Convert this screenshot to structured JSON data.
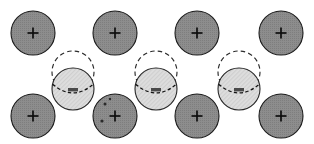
{
  "figure": {
    "canvas": {
      "width": 314,
      "height": 144,
      "background": "#ffffff"
    },
    "palette": {
      "dark_particle_fill": "#8a8a8a",
      "dark_particle_stroke": "#1a1a1a",
      "light_particle_fill": "#d9d9d9",
      "light_particle_stroke": "#262626",
      "ghost_stroke": "#2b2b2b",
      "marker_color": "#141414",
      "background": "#ffffff"
    },
    "legend_note": "",
    "rows": [
      {
        "name": "top-row",
        "kind": "dark-hatched-particle",
        "radius": 22,
        "center_y": 33,
        "marker": "plus",
        "particles": [
          {
            "id": "top-1",
            "cx": 33,
            "cy": 33
          },
          {
            "id": "top-2",
            "cx": 115,
            "cy": 33
          },
          {
            "id": "top-3",
            "cx": 197,
            "cy": 33
          },
          {
            "id": "top-4",
            "cx": 281,
            "cy": 33
          }
        ]
      },
      {
        "name": "middle-row",
        "kind": "light-particle-with-ghost",
        "radius": 21,
        "ghost_radius": 21,
        "ghost_center_y": 72,
        "center_y": 89,
        "marker": "dashed-chord",
        "particles": [
          {
            "id": "mid-1",
            "cx": 73,
            "cy": 89,
            "ghost_cx": 73,
            "ghost_cy": 72
          },
          {
            "id": "mid-2",
            "cx": 156,
            "cy": 89,
            "ghost_cx": 156,
            "ghost_cy": 72
          },
          {
            "id": "mid-3",
            "cx": 239,
            "cy": 89,
            "ghost_cx": 239,
            "ghost_cy": 72
          }
        ]
      },
      {
        "name": "bottom-row",
        "kind": "dark-hatched-particle",
        "radius": 22,
        "center_y": 116,
        "marker": "plus",
        "particles": [
          {
            "id": "bot-1",
            "cx": 33,
            "cy": 116
          },
          {
            "id": "bot-2",
            "cx": 115,
            "cy": 116
          },
          {
            "id": "bot-3",
            "cx": 197,
            "cy": 116
          },
          {
            "id": "bot-4",
            "cx": 281,
            "cy": 116
          }
        ]
      }
    ]
  }
}
